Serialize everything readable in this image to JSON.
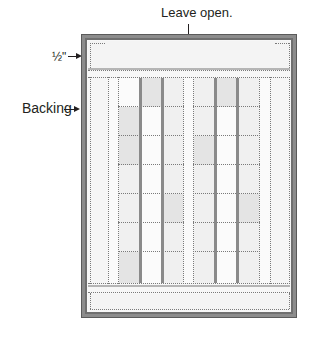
{
  "labels": {
    "top": "Leave open.",
    "seam": "½\"",
    "side": "Backing"
  },
  "colors": {
    "frame": "#8c8c8c",
    "panel": "#f7f7f7",
    "cell_white": "#fbfbfb",
    "cell_light": "#f0f0f0",
    "cell_shaded": "#e4e4e4",
    "seam_line": "#7a7a7a",
    "sash_line": "#8a8a8a"
  },
  "grid": {
    "rows": 7,
    "left_block_columns": [
      "A",
      "B",
      "C"
    ],
    "right_block_columns": [
      "D",
      "E",
      "F"
    ],
    "left_block_shading": [
      [
        "white",
        "shaded",
        "light"
      ],
      [
        "shaded",
        "white",
        "light"
      ],
      [
        "shaded",
        "white",
        "light"
      ],
      [
        "light",
        "white",
        "light"
      ],
      [
        "light",
        "white",
        "shaded"
      ],
      [
        "light",
        "white",
        "light"
      ],
      [
        "shaded",
        "white",
        "light"
      ]
    ],
    "right_block_shading": [
      [
        "light",
        "shaded",
        "light"
      ],
      [
        "light",
        "white",
        "light"
      ],
      [
        "shaded",
        "white",
        "light"
      ],
      [
        "light",
        "white",
        "light"
      ],
      [
        "light",
        "white",
        "shaded"
      ],
      [
        "light",
        "white",
        "light"
      ],
      [
        "light",
        "white",
        "light"
      ]
    ]
  }
}
